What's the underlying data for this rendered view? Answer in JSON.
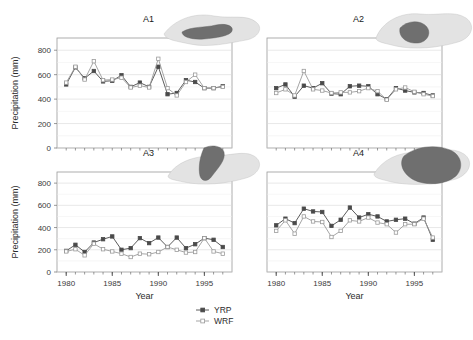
{
  "figure": {
    "xlabel": "Year",
    "ylabel": "Precipitation (mm)",
    "x_ticks": [
      "1980",
      "1985",
      "1990",
      "1995"
    ],
    "x_tick_values": [
      1980,
      1985,
      1990,
      1995
    ],
    "y_ticks": [
      "0",
      "200",
      "400",
      "600",
      "800"
    ],
    "y_tick_values": [
      0,
      200,
      400,
      600,
      800
    ],
    "xlim": [
      1979,
      1998
    ],
    "ylim": [
      0,
      900
    ],
    "grid": "horizontal",
    "legend_position": "bottom-center"
  },
  "legend": {
    "entries": [
      {
        "label": "YRP",
        "color": "#4a4a4a",
        "marker": "filled-square"
      },
      {
        "label": "WRF",
        "color": "#9b9b9b",
        "marker": "open-square"
      }
    ]
  },
  "colors": {
    "yrp": "#4a4a4a",
    "wrf": "#9b9b9b",
    "frame": "#9a9a9a",
    "grid": "#d9d9d9",
    "inset_fill": "#e3e3e3",
    "inset_highlight": "#6f6f6f"
  },
  "panels": [
    {
      "id": "A1",
      "label": "A1",
      "position": "top-left",
      "show_ylabel": true,
      "show_yticks": true,
      "show_xticks": false,
      "ylim": [
        0,
        900
      ]
    },
    {
      "id": "A2",
      "label": "A2",
      "position": "top-right",
      "show_ylabel": false,
      "show_yticks": false,
      "show_xticks": false,
      "ylim": [
        0,
        900
      ]
    },
    {
      "id": "A3",
      "label": "A3",
      "position": "bottom-left",
      "show_ylabel": true,
      "show_yticks": true,
      "show_xticks": true,
      "ylim": [
        0,
        900
      ]
    },
    {
      "id": "A4",
      "label": "A4",
      "position": "bottom-right",
      "show_ylabel": false,
      "show_yticks": false,
      "show_xticks": true,
      "ylim": [
        0,
        900
      ]
    }
  ],
  "chart_data": [
    {
      "type": "line",
      "panel": "A1",
      "title": "A1",
      "xlabel": "Year",
      "ylabel": "Precipitation (mm)",
      "xlim": [
        1979,
        1998
      ],
      "ylim": [
        0,
        900
      ],
      "grid": "horizontal",
      "legend_position": "bottom-center",
      "x": [
        1980,
        1981,
        1982,
        1983,
        1984,
        1985,
        1986,
        1987,
        1988,
        1989,
        1990,
        1991,
        1992,
        1993,
        1994,
        1995,
        1996,
        1997
      ],
      "series": [
        {
          "name": "YRP",
          "values": [
            520,
            660,
            570,
            630,
            545,
            550,
            595,
            500,
            535,
            500,
            665,
            440,
            450,
            555,
            540,
            490,
            490,
            505,
            465
          ]
        },
        {
          "name": "WRF",
          "values": [
            535,
            665,
            560,
            710,
            555,
            560,
            575,
            495,
            510,
            495,
            730,
            490,
            430,
            540,
            600,
            490,
            490,
            500,
            475
          ]
        }
      ]
    },
    {
      "type": "line",
      "panel": "A2",
      "title": "A2",
      "xlabel": "Year",
      "ylabel": "Precipitation (mm)",
      "xlim": [
        1979,
        1998
      ],
      "ylim": [
        0,
        900
      ],
      "grid": "horizontal",
      "legend_position": "bottom-center",
      "x": [
        1980,
        1981,
        1982,
        1983,
        1984,
        1985,
        1986,
        1987,
        1988,
        1989,
        1990,
        1991,
        1992,
        1993,
        1994,
        1995,
        1996,
        1997
      ],
      "series": [
        {
          "name": "YRP",
          "values": [
            490,
            520,
            420,
            510,
            490,
            530,
            445,
            440,
            505,
            510,
            505,
            440,
            400,
            490,
            470,
            455,
            450,
            430,
            425
          ]
        },
        {
          "name": "WRF",
          "values": [
            450,
            480,
            430,
            630,
            480,
            470,
            450,
            455,
            455,
            465,
            490,
            465,
            395,
            480,
            495,
            460,
            440,
            425,
            420
          ]
        }
      ]
    },
    {
      "type": "line",
      "panel": "A3",
      "title": "A3",
      "xlabel": "Year",
      "ylabel": "Precipitation (mm)",
      "xlim": [
        1979,
        1998
      ],
      "ylim": [
        0,
        900
      ],
      "grid": "horizontal",
      "legend_position": "bottom-center",
      "x": [
        1980,
        1981,
        1982,
        1983,
        1984,
        1985,
        1986,
        1987,
        1988,
        1989,
        1990,
        1991,
        1992,
        1993,
        1994,
        1995,
        1996,
        1997
      ],
      "series": [
        {
          "name": "YRP",
          "values": [
            190,
            245,
            180,
            265,
            295,
            320,
            200,
            215,
            305,
            260,
            310,
            225,
            310,
            215,
            250,
            305,
            290,
            225,
            215
          ]
        },
        {
          "name": "WRF",
          "values": [
            185,
            205,
            150,
            255,
            205,
            185,
            165,
            135,
            165,
            160,
            180,
            225,
            200,
            175,
            180,
            305,
            185,
            165,
            160
          ]
        }
      ]
    },
    {
      "type": "line",
      "panel": "A4",
      "title": "A4",
      "xlabel": "Year",
      "ylabel": "Precipitation (mm)",
      "xlim": [
        1979,
        1998
      ],
      "ylim": [
        0,
        900
      ],
      "grid": "horizontal",
      "legend_position": "bottom-center",
      "x": [
        1980,
        1981,
        1982,
        1983,
        1984,
        1985,
        1986,
        1987,
        1988,
        1989,
        1990,
        1991,
        1992,
        1993,
        1994,
        1995,
        1996,
        1997
      ],
      "series": [
        {
          "name": "YRP",
          "values": [
            420,
            480,
            440,
            570,
            545,
            540,
            415,
            470,
            580,
            490,
            520,
            500,
            455,
            470,
            480,
            435,
            490,
            290
          ]
        },
        {
          "name": "WRF",
          "values": [
            370,
            465,
            345,
            500,
            455,
            450,
            315,
            370,
            465,
            455,
            490,
            445,
            430,
            355,
            430,
            430,
            480,
            310
          ]
        }
      ]
    }
  ]
}
